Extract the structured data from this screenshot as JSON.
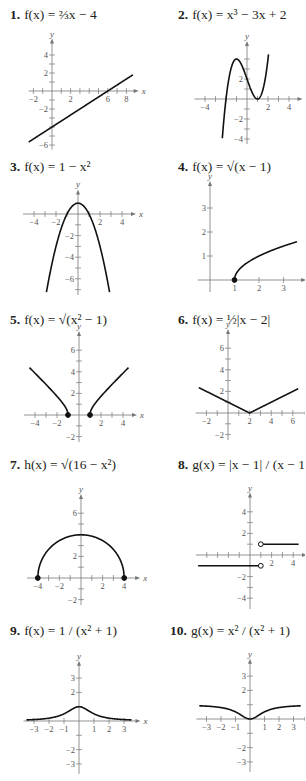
{
  "chart_data": [
    {
      "type": "line",
      "number": "1.",
      "title": "f(x) = ⅔x − 4",
      "func": "linear",
      "xlabel": "x",
      "ylabel": "y",
      "xlim": [
        -2.5,
        9
      ],
      "ylim": [
        -6.5,
        5.5
      ],
      "xticks": [
        -2,
        2,
        6,
        8
      ],
      "yticks": [
        -6,
        -2,
        2,
        4
      ],
      "x_minor": [
        -2,
        -1,
        1,
        2,
        3,
        4,
        5,
        6,
        7,
        8
      ],
      "y_minor": [
        -6,
        -5,
        -4,
        -3,
        -2,
        -1,
        1,
        2,
        3,
        4
      ],
      "domain": [
        -2.5,
        8.7
      ],
      "endpoints": []
    },
    {
      "type": "line",
      "number": "2.",
      "title": "f(x) = x³ − 3x + 2",
      "func": "cubic",
      "xlabel": "x",
      "ylabel": "y",
      "xlim": [
        -5,
        5
      ],
      "ylim": [
        -4.5,
        5.5
      ],
      "xticks": [
        -4,
        2,
        4
      ],
      "yticks": [
        -4,
        -2,
        2
      ],
      "x_minor": [
        -4,
        -3,
        -2,
        -1,
        1,
        2,
        3,
        4
      ],
      "y_minor": [
        -4,
        -3,
        -2,
        -1,
        1,
        2,
        3,
        4
      ],
      "domain": [
        -2.35,
        2.05
      ],
      "endpoints": []
    },
    {
      "type": "line",
      "number": "3.",
      "title": "f(x) = 1 − x²",
      "func": "neg_parabola",
      "xlabel": "x",
      "ylabel": "y",
      "xlim": [
        -5,
        5
      ],
      "ylim": [
        -7.5,
        2
      ],
      "xticks": [
        -4,
        -2,
        2,
        4
      ],
      "yticks": [
        -6,
        -4,
        -2
      ],
      "x_minor": [
        -4,
        -3,
        -2,
        -1,
        1,
        2,
        3,
        4
      ],
      "y_minor": [
        -7,
        -6,
        -5,
        -4,
        -3,
        -2,
        -1,
        1
      ],
      "domain": [
        -2.87,
        2.87
      ],
      "endpoints": []
    },
    {
      "type": "line",
      "number": "4.",
      "title": "f(x) = √(x − 1)",
      "func": "sqrt_shift",
      "xlabel": "",
      "ylabel": "y",
      "xlim": [
        -0.5,
        3.8
      ],
      "ylim": [
        -0.5,
        4
      ],
      "xticks": [
        1,
        2,
        3
      ],
      "yticks": [
        1,
        2,
        3
      ],
      "x_minor": [
        1,
        2,
        3
      ],
      "y_minor": [
        1,
        2,
        3
      ],
      "domain": [
        1,
        3.55
      ],
      "endpoints": [
        {
          "x": 1,
          "y": 0,
          "filled": true
        }
      ]
    },
    {
      "type": "line",
      "number": "5.",
      "title": "f(x) = √(x² − 1)",
      "func": "sqrt_hyper",
      "xlabel": "x",
      "ylabel": "y",
      "xlim": [
        -5,
        5
      ],
      "ylim": [
        -2.5,
        7.5
      ],
      "xticks": [
        -4,
        -2,
        2,
        4
      ],
      "yticks": [
        -2,
        2,
        4,
        6
      ],
      "x_minor": [
        -4,
        -3,
        -2,
        -1,
        1,
        2,
        3,
        4
      ],
      "y_minor": [
        -2,
        -1,
        1,
        2,
        3,
        4,
        5,
        6
      ],
      "domain": [
        [
          -4.5,
          -1
        ],
        [
          1,
          4.5
        ]
      ],
      "endpoints": [
        {
          "x": -1,
          "y": 0,
          "filled": true
        },
        {
          "x": 1,
          "y": 0,
          "filled": true
        }
      ]
    },
    {
      "type": "line",
      "number": "6.",
      "title": "f(x) = ½|x − 2|",
      "func": "half_abs",
      "xlabel": "x",
      "ylabel": "y",
      "xlim": [
        -3,
        7.3
      ],
      "ylim": [
        -2.5,
        7.5
      ],
      "xticks": [
        -2,
        2,
        4,
        6
      ],
      "yticks": [
        -2,
        2,
        4,
        6
      ],
      "x_minor": [
        -2,
        -1,
        1,
        2,
        3,
        4,
        5,
        6
      ],
      "y_minor": [
        -2,
        -1,
        1,
        2,
        3,
        4,
        5,
        6
      ],
      "domain": [
        -2.7,
        6.5
      ],
      "endpoints": []
    },
    {
      "type": "line",
      "number": "7.",
      "title": "h(x) = √(16 − x²)",
      "func": "semicircle",
      "xlabel": "x",
      "ylabel": "y",
      "xlim": [
        -5,
        5.2
      ],
      "ylim": [
        -2.5,
        7.5
      ],
      "xticks": [
        -4,
        -2,
        2,
        4
      ],
      "yticks": [
        -2,
        2,
        6
      ],
      "x_minor": [
        -4,
        -3,
        -2,
        -1,
        1,
        2,
        3,
        4
      ],
      "y_minor": [
        -2,
        -1,
        1,
        2,
        3,
        4,
        5,
        6
      ],
      "domain": [
        -4,
        4
      ],
      "endpoints": [
        {
          "x": -4,
          "y": 0,
          "filled": true
        },
        {
          "x": 4,
          "y": 0,
          "filled": true
        }
      ]
    },
    {
      "type": "line",
      "number": "8.",
      "title": "g(x) = |x − 1| / (x − 1)",
      "func": "sign_shift",
      "xlabel": "x",
      "ylabel": "y",
      "xlim": [
        -5,
        5
      ],
      "ylim": [
        -5,
        5.5
      ],
      "xticks": [
        2,
        4
      ],
      "yticks": [
        -4,
        -2,
        2,
        4
      ],
      "x_minor": [
        -4,
        -3,
        -2,
        -1,
        1,
        2,
        3,
        4
      ],
      "y_minor": [
        -4,
        -3,
        -2,
        -1,
        1,
        2,
        3,
        4
      ],
      "domain": [
        [
          -4.8,
          1
        ],
        [
          1,
          4.5
        ]
      ],
      "endpoints": [
        {
          "x": 1,
          "y": 1,
          "filled": false
        },
        {
          "x": 1,
          "y": -1,
          "filled": false
        }
      ]
    },
    {
      "type": "line",
      "number": "9.",
      "title": "f(x) = 1 / (x² + 1)",
      "func": "lorentz",
      "xlabel": "x",
      "ylabel": "y",
      "xlim": [
        -3.7,
        3.9
      ],
      "ylim": [
        -3.7,
        4
      ],
      "xticks": [
        -3,
        -2,
        -1,
        1,
        2,
        3
      ],
      "yticks": [
        -3,
        -2,
        2,
        3
      ],
      "x_minor": [
        -3,
        -2,
        -1,
        1,
        2,
        3
      ],
      "y_minor": [
        -3,
        -2,
        -1,
        1,
        2,
        3
      ],
      "domain": [
        -3.5,
        3.5
      ],
      "endpoints": []
    },
    {
      "type": "line",
      "number": "10.",
      "title": "g(x) = x² / (x² + 1)",
      "func": "lorentz_compl",
      "xlabel": "",
      "ylabel": "y",
      "xlim": [
        -3.7,
        3.9
      ],
      "ylim": [
        -3.7,
        4
      ],
      "xticks": [
        -3,
        -2,
        -1,
        1,
        2,
        3
      ],
      "yticks": [
        -3,
        -2,
        2,
        3
      ],
      "x_minor": [
        -3,
        -2,
        -1,
        1,
        2,
        3
      ],
      "y_minor": [
        -3,
        -2,
        -1,
        1,
        2,
        3
      ],
      "domain": [
        -3.5,
        3.5
      ],
      "endpoints": []
    }
  ]
}
